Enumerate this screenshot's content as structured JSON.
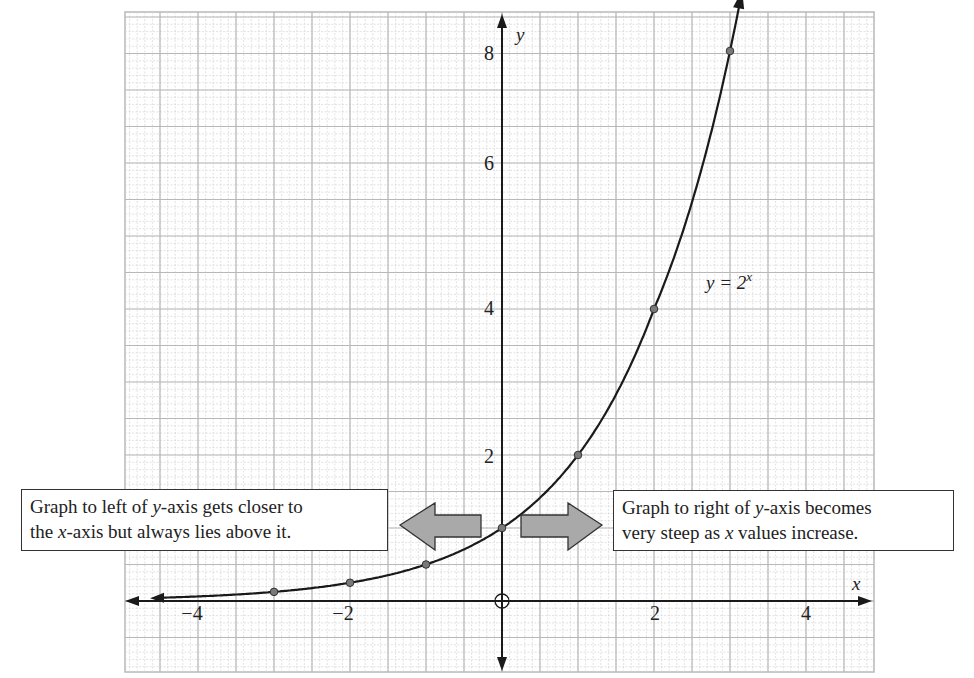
{
  "chart_data": {
    "type": "line",
    "title": "",
    "function_label": "y = 2^x",
    "function_label_parts": {
      "lhs": "y = 2",
      "exponent": "x"
    },
    "xlabel": "x",
    "ylabel": "y",
    "xlim": [
      -4.9,
      4.9
    ],
    "ylim": [
      -1,
      8.3
    ],
    "x_ticks": [
      -4,
      -2,
      2,
      4
    ],
    "x_tick_labels": [
      "−4",
      "−2",
      "2",
      "4"
    ],
    "y_ticks": [
      2,
      4,
      6,
      8
    ],
    "y_tick_labels": [
      "2",
      "4",
      "6",
      "8"
    ],
    "grid": true,
    "origin_marker": "circle",
    "series": [
      {
        "name": "y = 2^x",
        "x": [
          -3,
          -2,
          -1,
          0,
          1,
          2,
          3
        ],
        "y": [
          0.125,
          0.25,
          0.5,
          1,
          2,
          4,
          8
        ],
        "marked_points": true,
        "arrow_left": true,
        "arrow_right": true
      }
    ],
    "annotations": [
      {
        "id": "left",
        "text_parts": [
          "Graph to left of ",
          "y",
          "-axis gets closer to",
          "the ",
          "x",
          "-axis but always lies above it."
        ],
        "text": "Graph to left of y-axis gets closer to the x-axis but always lies above it.",
        "arrow_direction": "left"
      },
      {
        "id": "right",
        "text_parts": [
          "Graph to right of ",
          "y",
          "-axis becomes",
          "very steep as ",
          "x",
          " values increase."
        ],
        "text": "Graph to right of y-axis becomes very steep as x values increase.",
        "arrow_direction": "right"
      }
    ]
  },
  "colors": {
    "grid_major": "#b8b8b8",
    "grid_minor": "#d6d6d6",
    "axis": "#1a1a1a",
    "curve": "#1a1a1a",
    "point_fill": "#7a7a7a",
    "arrow_fill": "#a9a9a9",
    "text": "#222222"
  }
}
